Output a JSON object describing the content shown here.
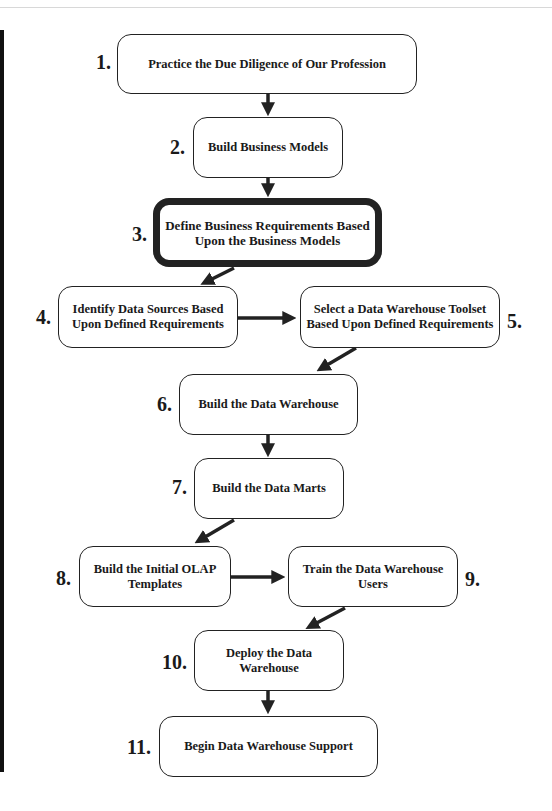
{
  "diagram": {
    "title": "",
    "steps": [
      {
        "number": "1.",
        "label": "Practice the Due Diligence of Our Profession"
      },
      {
        "number": "2.",
        "label": "Build Business Models"
      },
      {
        "number": "3.",
        "label": "Define Business Requirements Based Upon the Business Models",
        "highlighted": true
      },
      {
        "number": "4.",
        "label": "Identify Data Sources Based Upon Defined Requirements"
      },
      {
        "number": "5.",
        "label": "Select a Data Warehouse Toolset Based Upon Defined Requirements"
      },
      {
        "number": "6.",
        "label": "Build the Data Warehouse"
      },
      {
        "number": "7.",
        "label": "Build the Data Marts"
      },
      {
        "number": "8.",
        "label": "Build the Initial OLAP Templates"
      },
      {
        "number": "9.",
        "label": "Train the Data Warehouse Users"
      },
      {
        "number": "10.",
        "label": "Deploy the Data Warehouse"
      },
      {
        "number": "11.",
        "label": "Begin Data Warehouse Support"
      }
    ],
    "edges": [
      {
        "from": "1",
        "to": "2"
      },
      {
        "from": "2",
        "to": "3"
      },
      {
        "from": "3",
        "to": "4"
      },
      {
        "from": "4",
        "to": "5"
      },
      {
        "from": "5",
        "to": "6"
      },
      {
        "from": "6",
        "to": "7"
      },
      {
        "from": "7",
        "to": "8"
      },
      {
        "from": "8",
        "to": "9"
      },
      {
        "from": "9",
        "to": "10"
      },
      {
        "from": "10",
        "to": "11"
      }
    ],
    "colors": {
      "stroke": "#222222",
      "background": "#ffffff",
      "highlight_border": "#222222"
    }
  }
}
